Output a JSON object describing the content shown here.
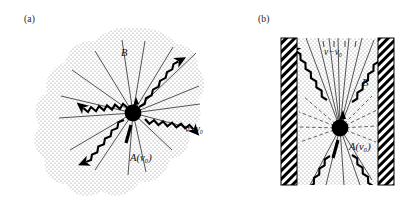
{
  "figure": {
    "type": "scientific-diagram",
    "panels": [
      {
        "id": "a",
        "label": "(a)",
        "description": "isotropic stippled cloud with central black scatterer emitting rays and wavy photon arrows",
        "labels": {
          "b_field": "B",
          "source": "A(ν₀)",
          "shifted": "ν−ν₀"
        }
      },
      {
        "id": "b",
        "label": "(b)",
        "description": "vertical channel between two hatched walls with stippled medium, central black scatterer, collimated rays and wavy photon arrows",
        "labels": {
          "b_field": "B",
          "source": "A(ν₀)",
          "shifted": "ν−ν₀"
        }
      }
    ],
    "colors": {
      "ink": "#000000",
      "background": "#ffffff",
      "stipple": "#9a9a9a",
      "hatch": "#000000"
    }
  }
}
